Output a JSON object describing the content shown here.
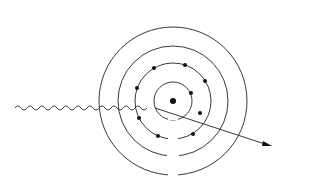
{
  "diagram": {
    "labels": {
      "incident_photon": "Incident photon",
      "characteristic_line1": "Characteristic",
      "characteristic_line2": "X - ray photon",
      "photoelectron": "Photoelectron"
    },
    "shells": [
      {
        "name": "K",
        "radius": 19
      },
      {
        "name": "L",
        "radius": 38
      },
      {
        "name": "M",
        "radius": 55
      },
      {
        "name": "N",
        "radius": 74
      }
    ],
    "nucleus": {
      "cx": 173,
      "cy": 101
    },
    "colors": {
      "ink": "#222222",
      "background": "#ffffff"
    }
  }
}
